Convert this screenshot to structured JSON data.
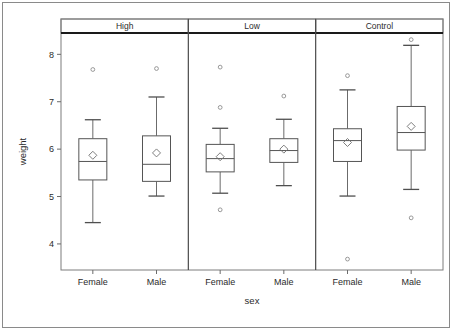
{
  "chart_data": {
    "type": "box",
    "title": "",
    "xlabel": "sex",
    "ylabel": "weight",
    "ylim": [
      3.45,
      8.45
    ],
    "yticks": [
      4,
      5,
      6,
      7,
      8
    ],
    "ytick_labels": [
      "4",
      "5",
      "6",
      "7",
      "8"
    ],
    "grid": false,
    "legend": "none",
    "panel_variable": "group",
    "panels": [
      "High",
      "Low",
      "Control"
    ],
    "categories": [
      "Female",
      "Male"
    ],
    "series": [
      {
        "panel": "High",
        "category": "Female",
        "min_whisker": 4.45,
        "q1": 5.35,
        "median": 5.74,
        "mean": 5.87,
        "q3": 6.22,
        "max_whisker": 6.62,
        "outliers": [
          7.68
        ]
      },
      {
        "panel": "High",
        "category": "Male",
        "min_whisker": 5.01,
        "q1": 5.32,
        "median": 5.68,
        "mean": 5.92,
        "q3": 6.28,
        "max_whisker": 7.1,
        "outliers": [
          7.7
        ]
      },
      {
        "panel": "Low",
        "category": "Female",
        "min_whisker": 5.07,
        "q1": 5.52,
        "median": 5.8,
        "mean": 5.84,
        "q3": 6.1,
        "max_whisker": 6.44,
        "outliers": [
          7.73,
          6.88,
          4.72
        ]
      },
      {
        "panel": "Low",
        "category": "Male",
        "min_whisker": 5.23,
        "q1": 5.72,
        "median": 5.97,
        "mean": 6.0,
        "q3": 6.22,
        "max_whisker": 6.63,
        "outliers": [
          7.12
        ]
      },
      {
        "panel": "Control",
        "category": "Female",
        "min_whisker": 5.01,
        "q1": 5.74,
        "median": 6.18,
        "mean": 6.14,
        "q3": 6.43,
        "max_whisker": 7.25,
        "outliers": [
          7.55,
          3.68
        ]
      },
      {
        "panel": "Control",
        "category": "Male",
        "min_whisker": 5.15,
        "q1": 5.98,
        "median": 6.35,
        "mean": 6.48,
        "q3": 6.9,
        "max_whisker": 8.19,
        "outliers": [
          8.31,
          4.55
        ]
      }
    ]
  },
  "axis": {
    "y_title": "weight",
    "x_title": "sex",
    "y_tick_labels": [
      "8",
      "7",
      "6",
      "5",
      "4"
    ]
  },
  "panels": [
    {
      "label": "High",
      "categories": [
        "Female",
        "Male"
      ]
    },
    {
      "label": "Low",
      "categories": [
        "Female",
        "Male"
      ]
    },
    {
      "label": "Control",
      "categories": [
        "Female",
        "Male"
      ]
    }
  ]
}
